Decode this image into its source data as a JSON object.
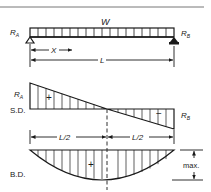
{
  "diagram": {
    "type": "simply-supported-beam-udl",
    "colors": {
      "ink": "#1a1a1a",
      "rule": "#555555",
      "background": "#ffffff"
    },
    "beam": {
      "load_label": "W",
      "left_reaction": {
        "main": "R",
        "sub": "A"
      },
      "right_reaction": {
        "main": "R",
        "sub": "B"
      },
      "load_cells": 18,
      "dim_x_label": "X",
      "dim_span_label": "L"
    },
    "shear_diagram": {
      "label": "S.D.",
      "left_reaction": {
        "main": "R",
        "sub": "A"
      },
      "right_reaction": {
        "main": "R",
        "sub": "B"
      },
      "positive_sign": "+",
      "negative_sign": "−",
      "half_span_left": "L/2",
      "half_span_right": "L/2"
    },
    "moment_diagram": {
      "label": "B.D.",
      "positive_sign": "+",
      "max_label": "max."
    }
  }
}
